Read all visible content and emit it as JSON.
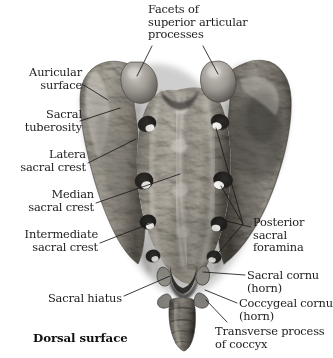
{
  "figure": {
    "caption": "Dorsal surface",
    "specimen": "sacrum-and-coccyx-dorsal-view",
    "background_color": "#ffffff",
    "bone_light_color": "#c9c6c0",
    "bone_mid_color": "#9a9690",
    "bone_dark_color": "#4e4b47",
    "foramen_color": "#23211f",
    "highlight_color": "#f2f0ec",
    "leader_line_color": "#1a1a1a",
    "text_color": "#1c1c1c"
  },
  "labels": {
    "facets": {
      "text": "Facets of\nsuperior articular\nprocesses",
      "x": 148,
      "y": 3,
      "align": "left"
    },
    "auricular": {
      "text": "Auricular\nsurface",
      "x": 10,
      "y": 66,
      "align": "right",
      "width": 72
    },
    "sacral_tuberosity": {
      "text": "Sacral\ntuberosity",
      "x": 4,
      "y": 108,
      "align": "right",
      "width": 78
    },
    "lateral_sacral_crest": {
      "text": "Latera\nsacral crest",
      "x": 4,
      "y": 148,
      "align": "right",
      "width": 86
    },
    "median_sacral_crest": {
      "text": "Median\nsacral crest",
      "x": 4,
      "y": 188,
      "align": "right",
      "width": 94
    },
    "intermediate_sacral_crest": {
      "text": "Intermediate\nsacral crest",
      "x": 4,
      "y": 228,
      "align": "right",
      "width": 98
    },
    "sacral_hiatus": {
      "text": "Sacral hiatus",
      "x": 4,
      "y": 292,
      "align": "right",
      "width": 122
    },
    "posterior_sacral_foramina": {
      "text": "Posterior\nsacral\nforamina",
      "x": 253,
      "y": 216,
      "align": "left"
    },
    "sacral_cornu": {
      "text": "Sacral cornu\n(horn)",
      "x": 247,
      "y": 269,
      "align": "left"
    },
    "coccygeal_cornu": {
      "text": "Coccygeal cornu\n(horn)",
      "x": 239,
      "y": 297,
      "align": "left"
    },
    "transverse_process": {
      "text": "Transverse process\nof coccyx",
      "x": 215,
      "y": 325,
      "align": "left"
    }
  },
  "caption": {
    "text": "Dorsal surface",
    "x": 33,
    "y": 331
  },
  "anatomy": {
    "superior_articular_processes": [
      {
        "name": "left-facet",
        "cx": 141,
        "cy": 75
      },
      {
        "name": "right-facet",
        "cx": 218,
        "cy": 73
      }
    ],
    "posterior_sacral_foramina": [
      {
        "side": "left",
        "cx": 147,
        "cy": 124
      },
      {
        "side": "left",
        "cx": 143,
        "cy": 181
      },
      {
        "side": "left",
        "cx": 147,
        "cy": 222
      },
      {
        "side": "left",
        "cx": 152,
        "cy": 256
      },
      {
        "side": "right",
        "cx": 220,
        "cy": 122
      },
      {
        "side": "right",
        "cx": 222,
        "cy": 180
      },
      {
        "side": "right",
        "cx": 219,
        "cy": 224
      },
      {
        "side": "right",
        "cx": 214,
        "cy": 257
      }
    ],
    "sacral_hiatus": {
      "cx": 183,
      "cy": 281
    },
    "coccyx_segments": 4
  }
}
